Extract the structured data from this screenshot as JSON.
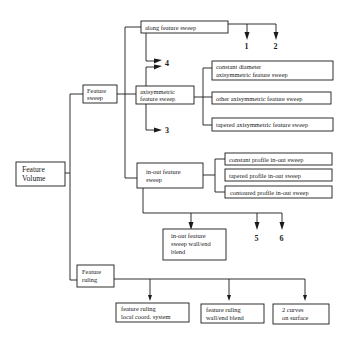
{
  "diagram": {
    "root": {
      "lines": [
        "Feature",
        "Volume"
      ]
    },
    "feature_sweep": {
      "lines": [
        "Feature",
        "sweep"
      ]
    },
    "along_feature_sweep": {
      "lines": [
        "along feature sweep"
      ]
    },
    "axisymmetric_feature_sweep": {
      "lines": [
        "axisymmetric",
        "feature sweep"
      ]
    },
    "constant_diameter": {
      "lines": [
        "constant diameter",
        "axisymmetric feature sweep"
      ]
    },
    "other_axisymmetric": {
      "lines": [
        "other axisymmetric feature sweep"
      ]
    },
    "tapered_axisymmetric": {
      "lines": [
        "tapered axisymmetric feature sweep"
      ]
    },
    "in_out_feature_sweep": {
      "lines": [
        "in-out feature",
        "sweep"
      ]
    },
    "constant_profile": {
      "lines": [
        "constant profile in-out sweep"
      ]
    },
    "tapered_profile": {
      "lines": [
        "tapered profile in-out sweep"
      ]
    },
    "contoured_profile": {
      "lines": [
        "contoured profile in-out sweep"
      ]
    },
    "in_out_wall_end_blend": {
      "lines": [
        "in-out feature",
        "sweep wall/end",
        "blend"
      ]
    },
    "feature_ruling": {
      "lines": [
        "Feature",
        "ruling"
      ]
    },
    "ruling_local_coord": {
      "lines": [
        "feature ruling",
        "local coord. system"
      ]
    },
    "ruling_wall_end_blend": {
      "lines": [
        "feature ruling",
        "wall/end blend"
      ]
    },
    "two_curves_on_surface": {
      "lines": [
        "2 curves",
        "on surface"
      ]
    },
    "reference_labels": {
      "r1": "1",
      "r2": "2",
      "r3": "3",
      "r4": "4",
      "r5": "5",
      "r6": "6"
    }
  }
}
